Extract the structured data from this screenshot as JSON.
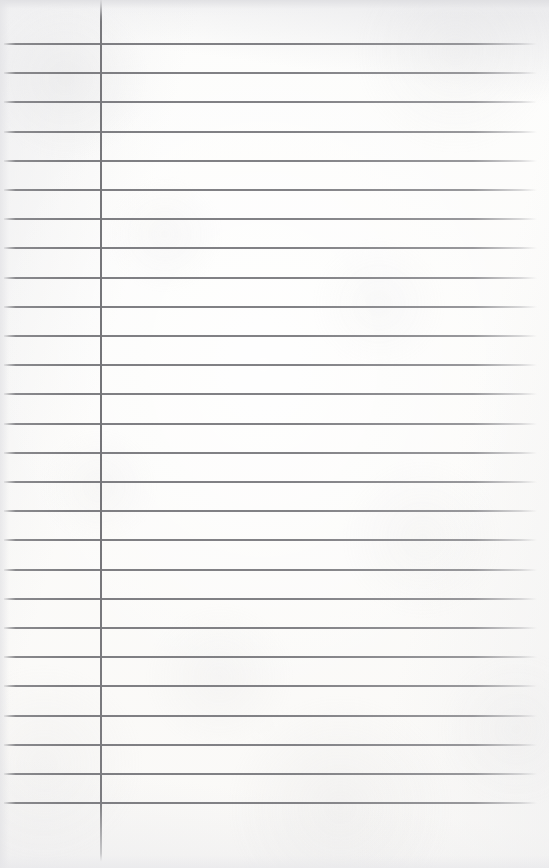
{
  "document": {
    "kind": "lined-notepad-paper",
    "title": "Blank lined paper sheet",
    "width": 549,
    "height": 868,
    "text_content": "",
    "handwriting": "",
    "printed_text": ""
  },
  "paper": {
    "background_color": "#fdfdfc",
    "edge_shadow_color": "#e2e2e5",
    "is_blank": "true"
  },
  "ruling": {
    "rule_color": "#808084",
    "rule_thickness_px": 2,
    "line_spacing_px": 29.2,
    "first_line_y": 43,
    "last_line_y": 821,
    "line_count": 27,
    "line_start_x": 4,
    "line_end_x": 537,
    "lines_y": [
      43,
      72.2,
      101.4,
      130.6,
      159.8,
      189,
      218.2,
      247.4,
      276.6,
      305.8,
      335,
      364.2,
      393.4,
      422.6,
      451.8,
      481,
      510.2,
      539.4,
      568.6,
      597.8,
      627,
      656.2,
      685.4,
      714.6,
      743.8,
      773,
      802.2
    ]
  },
  "margin_rule": {
    "orientation": "vertical",
    "color": "#78787c",
    "thickness_px": 2,
    "x": 100,
    "top_y": 0,
    "bottom_y": 862
  }
}
